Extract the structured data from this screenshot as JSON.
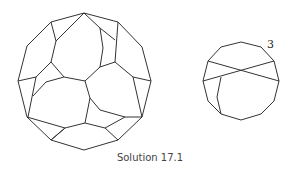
{
  "caption": "Solution 17.1",
  "diagrams": [
    {
      "name": "large-polyhedron-net",
      "description": "12-gon subdivided into faces"
    },
    {
      "name": "small-12-gon",
      "label": "3"
    }
  ],
  "colors": {
    "stroke": "#333333",
    "background": "#ffffff"
  }
}
